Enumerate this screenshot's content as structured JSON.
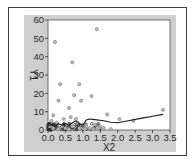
{
  "chart_data": {
    "type": "scatter",
    "title": "",
    "xlabel": "X2",
    "ylabel": "Y1",
    "xlim": [
      0.0,
      3.5
    ],
    "ylim": [
      0,
      60
    ],
    "x_ticks": [
      "0.0",
      "0.5",
      "1.0",
      "1.5",
      "2.0",
      "2.5",
      "3.0",
      "3.5"
    ],
    "y_ticks": [
      "0",
      "10",
      "20",
      "30",
      "40",
      "50",
      "60"
    ],
    "grid": false,
    "legend": null,
    "series": [
      {
        "name": "observations",
        "kind": "scatter",
        "marker": "open-circle",
        "points": [
          [
            0.2,
            48
          ],
          [
            1.4,
            55
          ],
          [
            0.7,
            37
          ],
          [
            0.35,
            25
          ],
          [
            0.9,
            25
          ],
          [
            0.75,
            19
          ],
          [
            0.3,
            16
          ],
          [
            0.95,
            16
          ],
          [
            1.25,
            18.5
          ],
          [
            0.6,
            12
          ],
          [
            0.15,
            8
          ],
          [
            1.7,
            8.5
          ],
          [
            2.05,
            6
          ],
          [
            2.45,
            5
          ],
          [
            3.3,
            11
          ],
          [
            0.1,
            5
          ],
          [
            0.25,
            4
          ],
          [
            0.45,
            6
          ],
          [
            0.55,
            3
          ],
          [
            0.65,
            7
          ],
          [
            0.8,
            6
          ],
          [
            0.85,
            4
          ],
          [
            1.0,
            3
          ],
          [
            1.1,
            2
          ],
          [
            1.2,
            1
          ],
          [
            1.35,
            3
          ],
          [
            1.5,
            2
          ],
          [
            1.6,
            1
          ],
          [
            1.8,
            0.5
          ],
          [
            0.05,
            2
          ],
          [
            0.15,
            1
          ],
          [
            0.3,
            0.5
          ],
          [
            0.4,
            2
          ],
          [
            0.5,
            1
          ],
          [
            0.6,
            0.5
          ],
          [
            0.7,
            2
          ],
          [
            0.9,
            1
          ],
          [
            1.05,
            0.5
          ],
          [
            1.3,
            0.5
          ],
          [
            1.45,
            1
          ]
        ]
      },
      {
        "name": "smooth fit",
        "kind": "line",
        "points": [
          [
            0.0,
            2
          ],
          [
            0.1,
            3
          ],
          [
            0.2,
            2
          ],
          [
            0.3,
            3.5
          ],
          [
            0.4,
            2.5
          ],
          [
            0.5,
            3.5
          ],
          [
            0.6,
            2.5
          ],
          [
            0.7,
            4
          ],
          [
            0.8,
            5
          ],
          [
            0.9,
            3.5
          ],
          [
            1.0,
            2.5
          ],
          [
            1.1,
            5.5
          ],
          [
            1.2,
            6
          ],
          [
            1.4,
            5.5
          ],
          [
            1.6,
            5
          ],
          [
            1.8,
            4.2
          ],
          [
            2.0,
            4
          ],
          [
            2.3,
            5
          ],
          [
            2.7,
            6.5
          ],
          [
            3.0,
            7.5
          ],
          [
            3.3,
            8.5
          ]
        ]
      }
    ]
  },
  "colors": {
    "panel_bg": "#cfcfcf",
    "plot_bg": "#ffffff",
    "frame": "#3a3a3a",
    "marker": "#8a8a8a",
    "line": "#1a1a1a",
    "cluster": "#222222"
  }
}
